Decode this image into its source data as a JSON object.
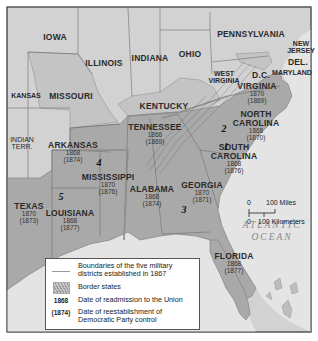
{
  "map": {
    "title": "Reconstruction military districts, 1867",
    "colors": {
      "background": "#ffffff",
      "frame": "#555555",
      "union_state": "#d2d2d2",
      "confederate_state": "#a9a9a9",
      "border_state": "#c4c4c4",
      "ocean": "#e4e4e4",
      "district_boundary": "#8d8d8d"
    },
    "non_southern_states": [
      "IOWA",
      "ILLINOIS",
      "INDIANA",
      "OHIO",
      "PENNSYLVANIA",
      "NEW JERSEY",
      "KANSAS",
      "WEST VIRGINIA"
    ],
    "border_states": [
      "MISSOURI",
      "KENTUCKY",
      "MARYLAND",
      "DEL."
    ],
    "territories": [
      "INDIAN TERR."
    ],
    "other_labels": [
      "D.C."
    ],
    "southern_states": [
      {
        "name": "VIRGINIA",
        "readmission": "1870",
        "democratic_control": "(1869)"
      },
      {
        "name": "NORTH CAROLINA",
        "line1": "NORTH",
        "line2": "CAROLINA",
        "readmission": "1868",
        "democratic_control": "(1870)"
      },
      {
        "name": "SOUTH CAROLINA",
        "line1": "SOUTH",
        "line2": "CAROLINA",
        "readmission": "1868",
        "democratic_control": "(1876)"
      },
      {
        "name": "TENNESSEE",
        "readmission": "1866",
        "democratic_control": "(1869)"
      },
      {
        "name": "GEORGIA",
        "readmission": "1870",
        "democratic_control": "(1871)"
      },
      {
        "name": "ALABAMA",
        "readmission": "1868",
        "democratic_control": "(1874)"
      },
      {
        "name": "MISSISSIPPI",
        "readmission": "1870",
        "democratic_control": "(1876)"
      },
      {
        "name": "ARKANSAS",
        "readmission": "1868",
        "democratic_control": "(1874)"
      },
      {
        "name": "LOUISIANA",
        "readmission": "1868",
        "democratic_control": "(1877)"
      },
      {
        "name": "TEXAS",
        "readmission": "1870",
        "democratic_control": "(1873)"
      },
      {
        "name": "FLORIDA",
        "readmission": "1868",
        "democratic_control": "(1877)"
      }
    ],
    "military_districts": [
      "1",
      "2",
      "3",
      "4",
      "5"
    ],
    "ocean_label": {
      "line1": "ATLANTIC",
      "line2": "OCEAN"
    },
    "scale": {
      "miles_zero": "0",
      "miles_label": "100 Miles",
      "km_zero": "0",
      "km_label": "100 Kilometers"
    }
  },
  "legend": {
    "items": [
      {
        "key": "line",
        "text_line1": "Boundaries of the five military",
        "text_line2": "districts established in 1867"
      },
      {
        "key": "swatch",
        "text_line1": "Border states"
      },
      {
        "key": "1868",
        "text_line1": "Date of readmission to the Union"
      },
      {
        "key": "(1874)",
        "text_line1": "Date of reestablishment of",
        "text_line2": "Democratic Party control"
      }
    ]
  }
}
